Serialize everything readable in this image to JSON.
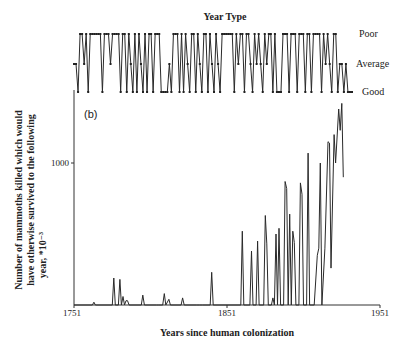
{
  "chart_data": [
    {
      "type": "line",
      "title": "Year Type",
      "panel": "top",
      "ylabel_levels": [
        "Poor",
        "Average",
        "Good"
      ],
      "level_values": {
        "Poor": 2,
        "Average": 1,
        "Good": 0
      },
      "x_start": 1751,
      "x_step": 1,
      "values": [
        1,
        1,
        0,
        2,
        2,
        1,
        2,
        0,
        2,
        2,
        2,
        2,
        2,
        2,
        0,
        2,
        2,
        2,
        1,
        2,
        2,
        2,
        2,
        0,
        2,
        2,
        0,
        2,
        1,
        0,
        2,
        0,
        2,
        1,
        0,
        2,
        0,
        2,
        2,
        0,
        2,
        2,
        2,
        0,
        0,
        0,
        0,
        1,
        0,
        2,
        2,
        2,
        0,
        2,
        0,
        2,
        1,
        0,
        2,
        2,
        0,
        2,
        1,
        0,
        2,
        2,
        0,
        2,
        1,
        0,
        2,
        1,
        0,
        2,
        2,
        2,
        2,
        2,
        2,
        0,
        2,
        1,
        2,
        2,
        0,
        2,
        2,
        1,
        0,
        2,
        1,
        2,
        1,
        0,
        2,
        1,
        2,
        2,
        0,
        2,
        0,
        0,
        0,
        2,
        2,
        2,
        0,
        2,
        2,
        2,
        0,
        2,
        2,
        2,
        0,
        2,
        2,
        0,
        2,
        2,
        2,
        2,
        0,
        2,
        1,
        2,
        1,
        0,
        2,
        2,
        0,
        1,
        1,
        0,
        1,
        0,
        0,
        0
      ]
    },
    {
      "type": "line",
      "panel": "bottom",
      "label": "(b)",
      "xlabel": "Years since human colonization",
      "ylabel": "Number of mammoths killed which would have otherwise survived to the following year, *10⁻³",
      "x_ticks": [
        1751,
        1851,
        1951
      ],
      "y_ticks": [
        1000
      ],
      "xlim": [
        1751,
        1951
      ],
      "ylim": [
        0,
        1500
      ],
      "grid": false,
      "x_start": 1751,
      "x_step": 1,
      "values": [
        0,
        0,
        0,
        0,
        0,
        0,
        0,
        0,
        0,
        0,
        0,
        0,
        0,
        20,
        0,
        0,
        0,
        0,
        0,
        0,
        0,
        0,
        0,
        0,
        0,
        0,
        0,
        0,
        0,
        0,
        0,
        0,
        0,
        0,
        0,
        0,
        0,
        0,
        0,
        0,
        0,
        0,
        0,
        0,
        0,
        0,
        0,
        0,
        0,
        0,
        0,
        0,
        0,
        0,
        0,
        0,
        0,
        0,
        0,
        0,
        0,
        0,
        0,
        0,
        0,
        0,
        0,
        0,
        0,
        0,
        0,
        0,
        0,
        0,
        0,
        0,
        0,
        0,
        0,
        0,
        0,
        0,
        0,
        0,
        0,
        0,
        0,
        0,
        0,
        0,
        0,
        0,
        0,
        0,
        0,
        0,
        0,
        0,
        0,
        0,
        0,
        0,
        0,
        0,
        0,
        0,
        0,
        0,
        0,
        0,
        0,
        0,
        0,
        0,
        0,
        0,
        0,
        0,
        0,
        0,
        0,
        0,
        0,
        0,
        0,
        0,
        0,
        0,
        0,
        0,
        0,
        0,
        0,
        0,
        0,
        0,
        0,
        0,
        0,
        0,
        0,
        0,
        0,
        0,
        0
      ],
      "points": [
        [
          1751,
          0
        ],
        [
          1763,
          0
        ],
        [
          1764,
          20
        ],
        [
          1765,
          0
        ],
        [
          1776,
          0
        ],
        [
          1777,
          190
        ],
        [
          1778,
          0
        ],
        [
          1780,
          0
        ],
        [
          1781,
          180
        ],
        [
          1782,
          0
        ],
        [
          1783,
          60
        ],
        [
          1784,
          0
        ],
        [
          1785,
          30
        ],
        [
          1786,
          30
        ],
        [
          1787,
          0
        ],
        [
          1795,
          0
        ],
        [
          1796,
          70
        ],
        [
          1797,
          0
        ],
        [
          1805,
          0
        ],
        [
          1806,
          0
        ],
        [
          1809,
          0
        ],
        [
          1810,
          80
        ],
        [
          1811,
          0
        ],
        [
          1813,
          40
        ],
        [
          1814,
          0
        ],
        [
          1821,
          0
        ],
        [
          1822,
          50
        ],
        [
          1823,
          0
        ],
        [
          1831,
          0
        ],
        [
          1832,
          0
        ],
        [
          1833,
          0
        ],
        [
          1834,
          0
        ],
        [
          1835,
          0
        ],
        [
          1840,
          0
        ],
        [
          1841,
          230
        ],
        [
          1842,
          0
        ],
        [
          1860,
          0
        ],
        [
          1861,
          520
        ],
        [
          1862,
          0
        ],
        [
          1866,
          0
        ],
        [
          1867,
          380
        ],
        [
          1868,
          0
        ],
        [
          1870,
          0
        ],
        [
          1871,
          450
        ],
        [
          1872,
          0
        ],
        [
          1875,
          0
        ],
        [
          1876,
          630
        ],
        [
          1877,
          430
        ],
        [
          1878,
          0
        ],
        [
          1880,
          0
        ],
        [
          1881,
          50
        ],
        [
          1882,
          0
        ],
        [
          1883,
          500
        ],
        [
          1884,
          0
        ],
        [
          1885,
          540
        ],
        [
          1886,
          0
        ],
        [
          1888,
          0
        ],
        [
          1889,
          870
        ],
        [
          1890,
          820
        ],
        [
          1891,
          0
        ],
        [
          1892,
          640
        ],
        [
          1893,
          0
        ],
        [
          1894,
          520
        ],
        [
          1895,
          440
        ],
        [
          1896,
          0
        ],
        [
          1898,
          0
        ],
        [
          1899,
          860
        ],
        [
          1900,
          780
        ],
        [
          1901,
          0
        ],
        [
          1903,
          0
        ],
        [
          1904,
          1070
        ],
        [
          1905,
          0
        ],
        [
          1906,
          0
        ],
        [
          1908,
          0
        ],
        [
          1910,
          350
        ],
        [
          1911,
          400
        ],
        [
          1912,
          1000
        ],
        [
          1913,
          0
        ],
        [
          1915,
          400
        ],
        [
          1917,
          1150
        ],
        [
          1918,
          1140
        ],
        [
          1919,
          260
        ],
        [
          1921,
          1200
        ],
        [
          1922,
          1000
        ],
        [
          1924,
          1380
        ],
        [
          1925,
          1230
        ],
        [
          1926,
          1420
        ],
        [
          1927,
          900
        ]
      ]
    }
  ],
  "labels": {
    "top_title": "Year Type",
    "level_poor": "Poor",
    "level_average": "Average",
    "level_good": "Good",
    "panel_label": "(b)",
    "y_tick_1000": "1000",
    "x_tick_1751": "1751",
    "x_tick_1851": "1851",
    "x_tick_1951": "1951",
    "xlabel": "Years since human colonization",
    "ylabel_line1": "Number of mammoths killed which would",
    "ylabel_line2": "have otherwise survived to the following",
    "ylabel_line3": "year, *10⁻³"
  }
}
